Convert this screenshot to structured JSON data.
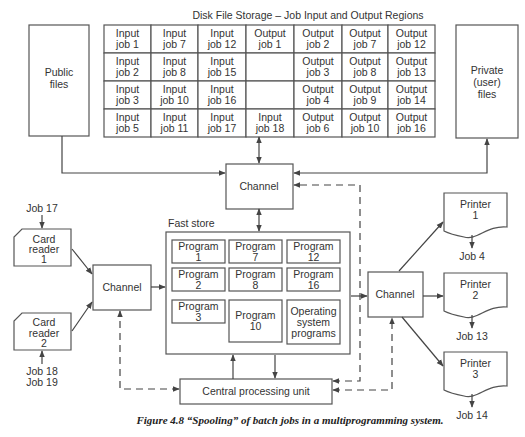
{
  "title": "Disk File Storage – Job Input and Output Regions",
  "public_files": [
    "Public",
    "files"
  ],
  "private_files": [
    "Private",
    "(user)",
    "files"
  ],
  "disk_grid": [
    [
      [
        "Input",
        "job 1"
      ],
      [
        "Input",
        "job 7"
      ],
      [
        "Input",
        "job 12"
      ],
      [
        "Output",
        "job 1"
      ],
      [
        "Output",
        "job 2"
      ],
      [
        "Output",
        "job 7"
      ],
      [
        "Output",
        "job 12"
      ]
    ],
    [
      [
        "Input",
        "job 2"
      ],
      [
        "Input",
        "job 8"
      ],
      [
        "Input",
        "job 15"
      ],
      [
        "",
        ""
      ],
      [
        "Output",
        "job 3"
      ],
      [
        "Output",
        "job 8"
      ],
      [
        "Output",
        "job 13"
      ]
    ],
    [
      [
        "Input",
        "job 3"
      ],
      [
        "Input",
        "job 10"
      ],
      [
        "Input",
        "job 16"
      ],
      [
        "",
        ""
      ],
      [
        "Output",
        "job 4"
      ],
      [
        "Output",
        "job 9"
      ],
      [
        "Output",
        "job 14"
      ]
    ],
    [
      [
        "Input",
        "job 5"
      ],
      [
        "Input",
        "job 11"
      ],
      [
        "Input",
        "job 17"
      ],
      [
        "Input",
        "job 18"
      ],
      [
        "Output",
        "job 6"
      ],
      [
        "Output",
        "job 10"
      ],
      [
        "Output",
        "job 16"
      ]
    ]
  ],
  "channels": {
    "disk": "Channel",
    "input": "Channel",
    "output": "Channel"
  },
  "card_readers": [
    {
      "lines": [
        "Card",
        "reader",
        "1"
      ],
      "jobs": [
        "Job 17"
      ]
    },
    {
      "lines": [
        "Card",
        "reader",
        "2"
      ],
      "jobs": [
        "Job 18",
        "Job 19"
      ]
    }
  ],
  "fast_store": {
    "label": "Fast store",
    "programs": [
      [
        "Program",
        "1"
      ],
      [
        "Program",
        "7"
      ],
      [
        "Program",
        "12"
      ],
      [
        "Program",
        "2"
      ],
      [
        "Program",
        "8"
      ],
      [
        "Program",
        "16"
      ],
      [
        "Program",
        "3"
      ],
      [
        "Program",
        "10"
      ],
      [
        "Operating",
        "system",
        "programs"
      ]
    ]
  },
  "cpu": "Central processing unit",
  "printers": [
    {
      "lines": [
        "Printer",
        "1"
      ],
      "job": "Job 4"
    },
    {
      "lines": [
        "Printer",
        "2"
      ],
      "job": "Job 13"
    },
    {
      "lines": [
        "Printer",
        "3"
      ],
      "job": "Job 14"
    }
  ],
  "caption": "Figure 4.8    “Spooling” of batch jobs in a multiprogramming system."
}
